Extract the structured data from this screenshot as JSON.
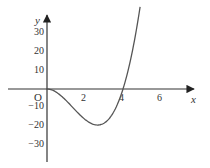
{
  "chart_data": {
    "type": "line",
    "title": "",
    "xlabel": "x",
    "ylabel": "y",
    "origin_label": "O",
    "x_ticks": [
      2,
      4,
      6
    ],
    "y_ticks": [
      30,
      20,
      10,
      -10,
      -20,
      -30
    ],
    "xlim": [
      -2,
      7.8
    ],
    "ylim": [
      -40,
      38
    ],
    "grid": false,
    "legend": null,
    "series": [
      {
        "name": "f(x)",
        "description": "cubic curve through origin, min about -19 near x≈2.7, crosses x-axis at x=4, rises steeply",
        "x": [
          0,
          0.5,
          1,
          1.5,
          2,
          2.5,
          2.67,
          3,
          3.5,
          4,
          4.5,
          4.9
        ],
        "y": [
          0,
          -1.75,
          -6,
          -11.25,
          -16,
          -18.75,
          -19,
          -18,
          -12.25,
          0,
          20.25,
          43
        ]
      }
    ]
  },
  "axes": {
    "x_label": "x",
    "y_label": "y",
    "origin": "O",
    "x_tick_labels": [
      "2",
      "4",
      "6"
    ],
    "y_tick_labels": [
      "30",
      "20",
      "10",
      "−10",
      "−20",
      "−30"
    ]
  }
}
